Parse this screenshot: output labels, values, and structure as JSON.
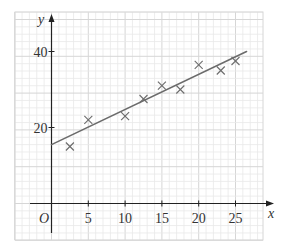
{
  "chart_data": {
    "type": "scatter",
    "title": "",
    "xlabel": "x",
    "ylabel": "y",
    "origin_label": "O",
    "xlim": [
      -3,
      27
    ],
    "ylim": [
      -9,
      50
    ],
    "grid": true,
    "x_ticks": [
      5,
      10,
      15,
      20,
      25
    ],
    "y_ticks": [
      20,
      40
    ],
    "points": [
      {
        "x": 2.5,
        "y": 15
      },
      {
        "x": 5,
        "y": 22
      },
      {
        "x": 10,
        "y": 23
      },
      {
        "x": 12.5,
        "y": 27.5
      },
      {
        "x": 15,
        "y": 31
      },
      {
        "x": 17.5,
        "y": 30
      },
      {
        "x": 20,
        "y": 36.5
      },
      {
        "x": 23,
        "y": 35
      },
      {
        "x": 25,
        "y": 37.5
      }
    ],
    "regression_line": {
      "x0": 0,
      "y0": 15.5,
      "x1": 26.5,
      "y1": 40
    },
    "marker": "x",
    "colors": {
      "grid_minor": "#e8e8e8",
      "grid_major": "#d6d6d6",
      "axis": "#222222",
      "line": "#6b6b6b",
      "marker": "#6b6b6b"
    }
  }
}
